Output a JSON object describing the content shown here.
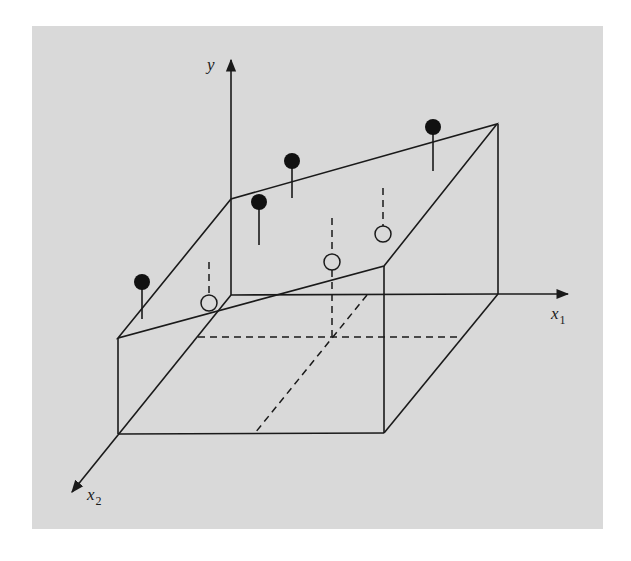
{
  "figure": {
    "background_color": "#d9d9d9",
    "line_color": "#1a1a1a"
  },
  "axes": {
    "y": {
      "label": "y"
    },
    "x1": {
      "label": "x",
      "subscript": "1"
    },
    "x2": {
      "label": "x",
      "subscript": "2"
    }
  },
  "points": {
    "observed_filled": [
      {
        "id": "obs-1",
        "cx": 142,
        "cy": 282,
        "stem_to": 319
      },
      {
        "id": "obs-2",
        "cx": 259,
        "cy": 202,
        "stem_to": 245
      },
      {
        "id": "obs-3",
        "cx": 292,
        "cy": 161,
        "stem_to": 198
      },
      {
        "id": "obs-4",
        "cx": 433,
        "cy": 127,
        "stem_to": 171
      }
    ],
    "predicted_open": [
      {
        "id": "pred-1",
        "cx": 209,
        "cy": 303,
        "dash_from": 262
      },
      {
        "id": "pred-2",
        "cx": 332,
        "cy": 262,
        "dash_from": 218
      },
      {
        "id": "pred-3",
        "cx": 383,
        "cy": 234,
        "dash_from": 188
      }
    ]
  }
}
